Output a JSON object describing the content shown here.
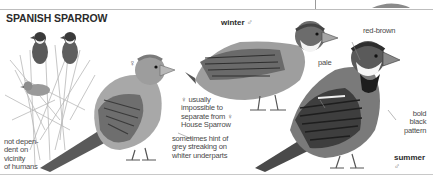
{
  "title": "SPANISH SPARROW",
  "plumages": {
    "female": {
      "symbol": "♀"
    },
    "winter_male": {
      "label": "winter",
      "symbol": "♂"
    },
    "summer_male": {
      "label": "summer",
      "symbol": "♂"
    }
  },
  "annotations": {
    "habitat": [
      "not depen-",
      "dent on",
      "vicinity",
      "of humans"
    ],
    "female_note": [
      "♀ usually",
      "impossible to",
      "separate from ♀",
      "House Sparrow"
    ],
    "female_streaking": [
      "sometimes hint of",
      "grey streaking on",
      "whiter underparts"
    ],
    "pale": "pale",
    "red_brown": "red-brown",
    "bold_black": [
      "bold",
      "black",
      "pattern"
    ]
  },
  "colors": {
    "text": "#3a3a3a",
    "rule": "#bdbdbd",
    "ink_dark": "#2a2a2a",
    "ink_mid": "#7a7a7a",
    "ink_light": "#c4c4c4"
  }
}
